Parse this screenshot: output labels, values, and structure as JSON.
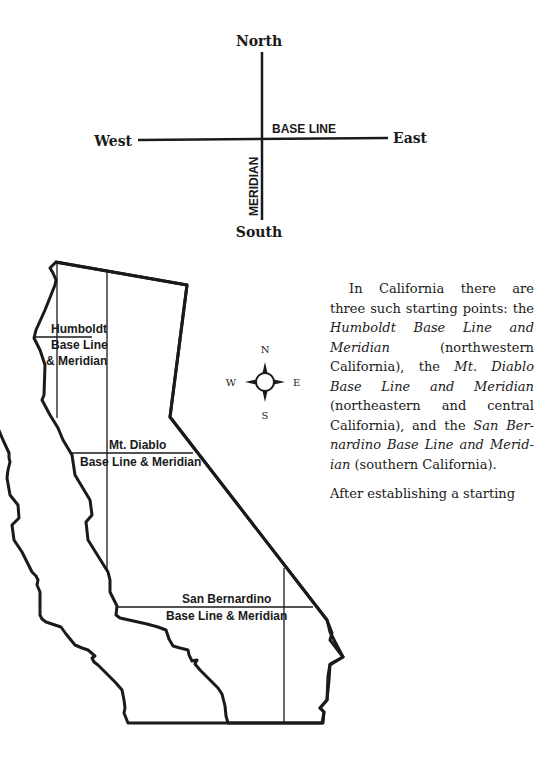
{
  "axes_diagram": {
    "north": "North",
    "south": "South",
    "east": "East",
    "west": "West",
    "base_line": "BASE LINE",
    "meridian": "MERIDIAN"
  },
  "map": {
    "humboldt_label": [
      "Humboldt",
      "Base Line",
      "& Meridian"
    ],
    "mt_diablo_label": [
      "Mt. Diablo",
      "Base Line & Meridian"
    ],
    "san_bernardino_label": [
      "San Bernardino",
      "Base Line & Meridian"
    ],
    "compass": {
      "n": "N",
      "s": "S",
      "e": "E",
      "w": "W"
    }
  },
  "body_text": {
    "p1": [
      {
        "t": "In California there are three such starting points: the ",
        "i": false
      },
      {
        "t": "Humboldt Base Line and Meridian",
        "i": true
      },
      {
        "t": " (northwestern California), the ",
        "i": false
      },
      {
        "t": "Mt. Diablo Base Line and Meridian",
        "i": true
      },
      {
        "t": " (northeastern and central California), and the ",
        "i": false
      },
      {
        "t": "San Ber­nardino Base Line and Merid­ian",
        "i": true
      },
      {
        "t": " (southern California).",
        "i": false
      }
    ],
    "p2": "After establishing a starting"
  }
}
